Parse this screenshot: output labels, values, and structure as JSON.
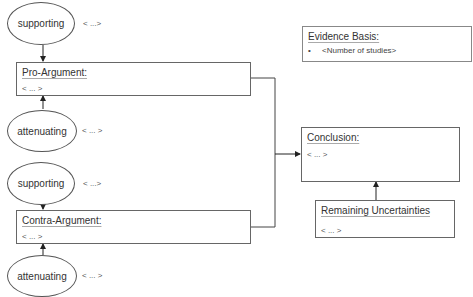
{
  "diagram": {
    "pro_group": {
      "supporting": {
        "label": "supporting",
        "note": "< ...>"
      },
      "argument": {
        "title": "Pro-Argument:",
        "body": "< ... >"
      },
      "attenuating": {
        "label": "attenuating",
        "note": "< ... >"
      }
    },
    "contra_group": {
      "supporting": {
        "label": "supporting",
        "note": "< ...>"
      },
      "argument": {
        "title": "Contra-Argument:",
        "body": "< ... >"
      },
      "attenuating": {
        "label": "attenuating",
        "note": "< ... >"
      }
    },
    "evidence": {
      "title": "Evidence Basis:",
      "items": [
        "<Number of studies>"
      ],
      "bullet": "•"
    },
    "conclusion": {
      "title": "Conclusion:",
      "body": "< ... >"
    },
    "uncertainties": {
      "title": "Remaining Uncertainties",
      "body": "< ... >"
    },
    "colors": {
      "line": "#333333",
      "border": "#666666",
      "text": "#333333"
    }
  }
}
